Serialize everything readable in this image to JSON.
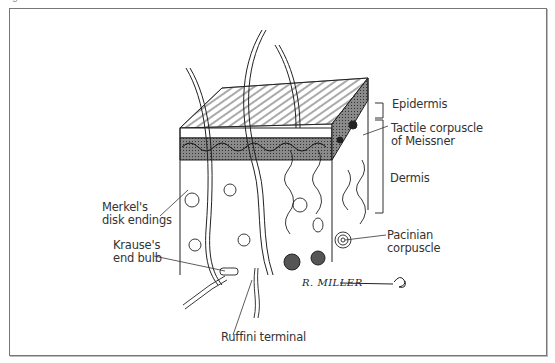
{
  "figure": {
    "caption_top": "Figure ...",
    "signature": "R. MILLER",
    "frame_color": "#777777",
    "line_color": "#222222",
    "shading_color": "#555555"
  },
  "labels": {
    "epidermis": "Epidermis",
    "meissner_line1": "Tactile corpuscle",
    "meissner_line2": "of Meissner",
    "dermis": "Dermis",
    "merkel_line1": "Merkel's",
    "merkel_line2": "disk endings",
    "krause_line1": "Krause's",
    "krause_line2": "end bulb",
    "pacinian_line1": "Pacinian",
    "pacinian_line2": "corpuscle",
    "ruffini": "Ruffini terminal"
  }
}
